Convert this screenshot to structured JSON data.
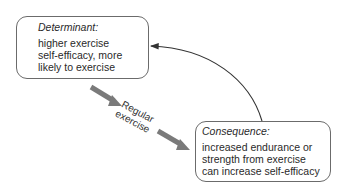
{
  "determinant": {
    "title": "Determinant:",
    "lines": [
      "higher exercise",
      "self-efficacy, more",
      "likely to exercise"
    ]
  },
  "consequence": {
    "title": "Consequence:",
    "lines": [
      "increased endurance or",
      "strength from exercise",
      "can increase self-efficacy"
    ]
  },
  "flow_label": {
    "line1": "Regular",
    "line2": "exercise"
  },
  "colors": {
    "box_border": "#6b6b6b",
    "thick_arrow": "#7a7a7a",
    "feedback_arrow": "#333333",
    "text": "#2a2a2a"
  }
}
